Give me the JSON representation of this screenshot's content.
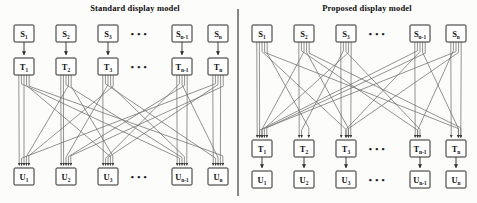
{
  "figure": {
    "kind": "block-diagram",
    "caption_visible": false,
    "divider": {
      "name": "panel-divider",
      "x": 238,
      "y1": 9,
      "y2": 196,
      "color": "#4a4a4a"
    }
  },
  "style": {
    "box_fill": "#ffffff",
    "box_stroke": "#2b2b2b",
    "wire_color": "#6f6f6f",
    "arrow_color": "#2b2b2b",
    "title_color": "#101010",
    "page_bg": "#fcfcfa"
  },
  "panels": [
    {
      "id": "standard",
      "title": "Standard display model",
      "title_x": 60,
      "origin_x": 0,
      "rows": [
        {
          "id": "S",
          "y": 25,
          "nodes": [
            {
              "label": "S",
              "sub": "1",
              "x": 14
            },
            {
              "label": "S",
              "sub": "2",
              "x": 56
            },
            {
              "label": "S",
              "sub": "3",
              "x": 98
            },
            {
              "label": "S",
              "sub": "n-1",
              "x": 172
            },
            {
              "label": "S",
              "sub": "n",
              "x": 208
            }
          ],
          "ellipsis_x": 139
        },
        {
          "id": "T",
          "y": 58,
          "nodes": [
            {
              "label": "T",
              "sub": "1",
              "x": 14
            },
            {
              "label": "T",
              "sub": "2",
              "x": 56
            },
            {
              "label": "T",
              "sub": "3",
              "x": 98
            },
            {
              "label": "T",
              "sub": "n-1",
              "x": 172
            },
            {
              "label": "T",
              "sub": "n",
              "x": 208
            }
          ],
          "ellipsis_x": 139
        },
        {
          "id": "U",
          "y": 168,
          "nodes": [
            {
              "label": "U",
              "sub": "1",
              "x": 14
            },
            {
              "label": "U",
              "sub": "2",
              "x": 56
            },
            {
              "label": "U",
              "sub": "3",
              "x": 98
            },
            {
              "label": "U",
              "sub": "n-1",
              "x": 172
            },
            {
              "label": "U",
              "sub": "n",
              "x": 208
            }
          ],
          "ellipsis_x": 139
        }
      ],
      "links": [
        {
          "from_row": "S",
          "to_row": "T",
          "kind": "one-to-one-arrow"
        },
        {
          "from_row": "T",
          "to_row": "U",
          "kind": "fan-out-bundle",
          "fan": 5
        }
      ]
    },
    {
      "id": "proposed",
      "title": "Proposed display model",
      "title_x": 292,
      "origin_x": 246,
      "rows": [
        {
          "id": "S",
          "y": 25,
          "nodes": [
            {
              "label": "S",
              "sub": "1",
              "x": 252
            },
            {
              "label": "S",
              "sub": "2",
              "x": 294
            },
            {
              "label": "S",
              "sub": "3",
              "x": 336
            },
            {
              "label": "S",
              "sub": "n-1",
              "x": 410
            },
            {
              "label": "S",
              "sub": "n",
              "x": 446
            }
          ],
          "ellipsis_x": 377
        },
        {
          "id": "T",
          "y": 140,
          "nodes": [
            {
              "label": "T",
              "sub": "1",
              "x": 252
            },
            {
              "label": "T",
              "sub": "2",
              "x": 294
            },
            {
              "label": "T",
              "sub": "3",
              "x": 336
            },
            {
              "label": "T",
              "sub": "n-1",
              "x": 410
            },
            {
              "label": "T",
              "sub": "n",
              "x": 446
            }
          ],
          "ellipsis_x": 377
        },
        {
          "id": "U",
          "y": 171,
          "nodes": [
            {
              "label": "U",
              "sub": "1",
              "x": 252
            },
            {
              "label": "U",
              "sub": "2",
              "x": 294
            },
            {
              "label": "U",
              "sub": "3",
              "x": 336
            },
            {
              "label": "U",
              "sub": "n-1",
              "x": 410
            },
            {
              "label": "U",
              "sub": "n",
              "x": 446
            }
          ],
          "ellipsis_x": 377
        }
      ],
      "links": [
        {
          "from_row": "S",
          "to_row": "T",
          "kind": "fan-out-bundle",
          "fan": 5
        },
        {
          "from_row": "T",
          "to_row": "U",
          "kind": "one-to-one-arrow"
        }
      ]
    }
  ],
  "ellipsis_glyph": "• • •"
}
